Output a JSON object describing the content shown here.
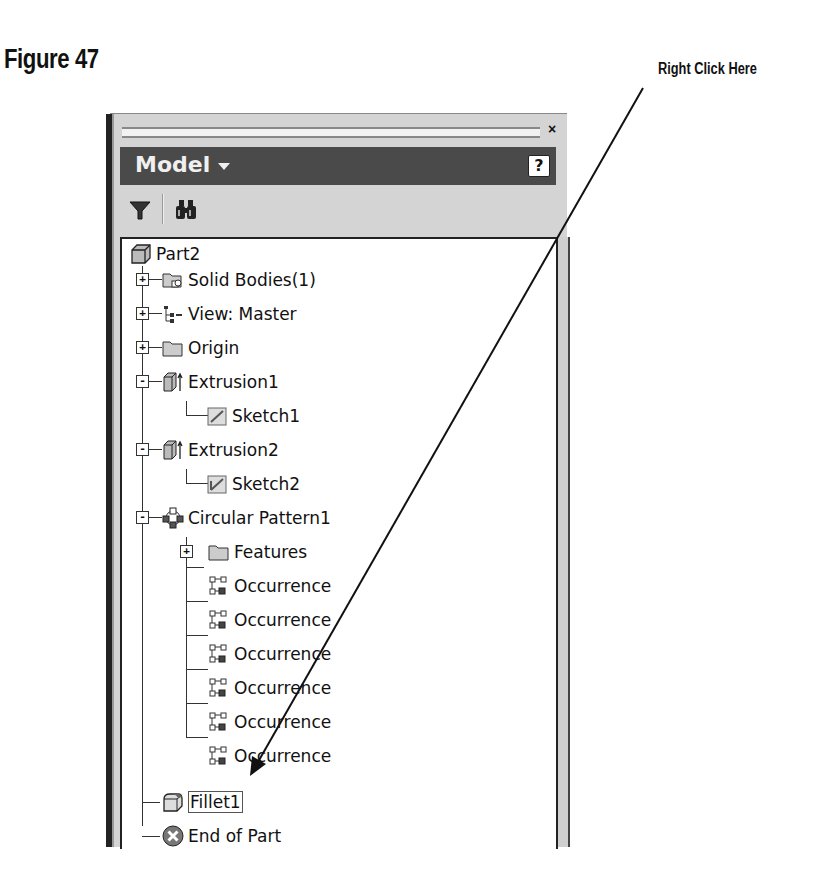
{
  "figure": {
    "title": "Figure 47"
  },
  "callout": {
    "label": "Right Click Here",
    "target": "Fillet1"
  },
  "panel": {
    "close_label": "×",
    "title": "Model",
    "help_label": "?",
    "toolbar": [
      {
        "name": "filter-icon"
      },
      {
        "name": "find-binoculars-icon"
      }
    ]
  },
  "tree": {
    "root": {
      "label": "Part2",
      "icon": "part-icon"
    },
    "items": [
      {
        "label": "Solid Bodies(1)",
        "icon": "solid-bodies-icon",
        "level": 1,
        "expander": "+"
      },
      {
        "label": "View: Master",
        "icon": "view-rep-icon",
        "level": 1,
        "expander": "+"
      },
      {
        "label": "Origin",
        "icon": "folder-icon",
        "level": 1,
        "expander": "+"
      },
      {
        "label": "Extrusion1",
        "icon": "extrusion-icon",
        "level": 1,
        "expander": "-"
      },
      {
        "label": "Sketch1",
        "icon": "sketch-icon",
        "level": 2
      },
      {
        "label": "Extrusion2",
        "icon": "extrusion-icon",
        "level": 1,
        "expander": "-"
      },
      {
        "label": "Sketch2",
        "icon": "sketch-icon",
        "level": 2
      },
      {
        "label": "Circular Pattern1",
        "icon": "circular-pattern-icon",
        "level": 1,
        "expander": "-"
      },
      {
        "label": "Features",
        "icon": "folder-icon",
        "level": 2,
        "expander": "+"
      },
      {
        "label": "Occurrence",
        "icon": "occurrence-icon",
        "level": 2
      },
      {
        "label": "Occurrence",
        "icon": "occurrence-icon",
        "level": 2
      },
      {
        "label": "Occurrence",
        "icon": "occurrence-icon",
        "level": 2
      },
      {
        "label": "Occurrence",
        "icon": "occurrence-icon",
        "level": 2
      },
      {
        "label": "Occurrence",
        "icon": "occurrence-icon",
        "level": 2
      },
      {
        "label": "Occurrence",
        "icon": "occurrence-icon",
        "level": 2
      },
      {
        "label": "Fillet1",
        "icon": "fillet-icon",
        "level": 1,
        "selected": true
      },
      {
        "label": "End of Part",
        "icon": "end-of-part-icon",
        "level": 1
      }
    ]
  }
}
